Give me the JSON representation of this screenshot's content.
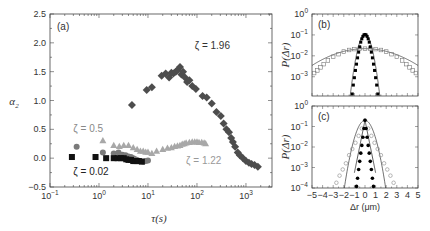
{
  "chart_data": [
    {
      "panel": "(a)",
      "type": "scatter",
      "title": "",
      "xlabel": "τ(s)",
      "ylabel": "α2",
      "xscale": "log",
      "xlim": [
        0.1,
        3400
      ],
      "ylim": [
        -0.5,
        2.5
      ],
      "xticks": [
        "10^-1",
        "10^0",
        "10^1",
        "10^2",
        "10^3"
      ],
      "yticks": [
        "-0.5",
        "0.0",
        "0.5",
        "1.0",
        "1.5",
        "2.0",
        "2.5"
      ],
      "grid": false,
      "series": [
        {
          "name": "ζ = 0.02",
          "marker": "square",
          "color": "#111111",
          "x": [
            0.28,
            0.85,
            1.4,
            2.0,
            2.4,
            2.8,
            3.2,
            3.6,
            4.0,
            4.5,
            5.0,
            5.5,
            6.0,
            6.5,
            7.5
          ],
          "y": [
            0.02,
            0.02,
            0.0,
            0.0,
            0.0,
            0.0,
            0.0,
            -0.02,
            -0.03,
            -0.03,
            -0.05,
            -0.05,
            -0.05,
            -0.05,
            -0.06
          ]
        },
        {
          "name": "ζ = 0.5",
          "marker": "circle",
          "color": "#7a7a7a",
          "x": [
            0.35,
            1.2,
            2.0,
            2.5,
            3.0,
            3.5,
            4.0,
            4.5,
            5.0,
            5.5,
            6.0,
            7.0,
            8.0,
            9.0,
            10.0
          ],
          "y": [
            0.2,
            0.1,
            0.08,
            0.1,
            0.06,
            0.05,
            0.03,
            0.02,
            0.0,
            -0.02,
            -0.03,
            -0.05,
            -0.06,
            -0.05,
            -0.04
          ]
        },
        {
          "name": "ζ = 1.22",
          "marker": "triangle",
          "color": "#a8a8a8",
          "x": [
            1.2,
            2.0,
            2.6,
            3.2,
            4.0,
            5.0,
            6.0,
            7.0,
            8.0,
            9.0,
            10.0,
            12.0,
            15.0,
            20.0,
            25.0,
            30.0,
            35.0,
            40.0,
            45.0,
            50.0,
            55.0,
            60.0,
            70.0,
            80.0,
            90.0,
            100.0,
            110.0,
            125.0,
            140.0,
            150.0
          ],
          "y": [
            0.3,
            0.22,
            0.2,
            0.22,
            0.22,
            0.18,
            0.15,
            0.12,
            0.12,
            0.1,
            0.1,
            0.08,
            0.12,
            0.15,
            0.17,
            0.18,
            0.2,
            0.21,
            0.22,
            0.24,
            0.25,
            0.26,
            0.27,
            0.28,
            0.28,
            0.28,
            0.27,
            0.27,
            0.26,
            0.25
          ]
        },
        {
          "name": "ζ = 1.96",
          "marker": "diamond",
          "color": "#4d4d4d",
          "x": [
            4.7,
            9.4,
            12.0,
            19.0,
            23.0,
            27.0,
            30.0,
            33.0,
            37.0,
            40.0,
            45.0,
            48.0,
            52.0,
            57.0,
            63.0,
            70.0,
            80.0,
            95.0,
            130.0,
            158.0,
            200.0,
            250.0,
            307.0,
            350.0,
            400.0,
            450.0,
            500.0,
            540.0,
            600.0,
            680.0,
            750.0,
            870.0,
            1000.0,
            1150.0,
            1300.0,
            1500.0,
            1750.0
          ],
          "y": [
            0.92,
            1.18,
            1.23,
            1.43,
            1.47,
            1.4,
            1.48,
            1.47,
            1.5,
            1.53,
            1.58,
            1.45,
            1.5,
            1.4,
            1.32,
            1.35,
            1.25,
            1.2,
            1.08,
            1.05,
            0.95,
            0.8,
            0.73,
            0.6,
            0.5,
            0.45,
            0.35,
            0.28,
            0.2,
            0.1,
            0.05,
            0.0,
            -0.05,
            -0.08,
            -0.1,
            -0.12,
            -0.15
          ]
        }
      ],
      "annotations": [
        {
          "text": "ζ = 1.96",
          "x": 90,
          "y": 1.9
        },
        {
          "text": "ζ = 0.5",
          "x": 0.3,
          "y": 0.45
        },
        {
          "text": "ζ = 1.22",
          "x": 60,
          "y": -0.1
        },
        {
          "text": "ζ = 0.02",
          "x": 0.3,
          "y": -0.3
        }
      ]
    },
    {
      "panel": "(b)",
      "type": "scatter",
      "xlabel": "",
      "ylabel": "P(Δr)",
      "yscale": "log",
      "xlim": [
        -5,
        5
      ],
      "ylim": [
        0.00012,
        1
      ],
      "yticks": [
        "10^0",
        "10^-1",
        "10^-2",
        "10^-3"
      ],
      "series": [
        {
          "name": "narrow (filled)",
          "marker": "filled-square",
          "color": "#000000",
          "x": [
            -1.2,
            -1.1,
            -1.0,
            -0.9,
            -0.8,
            -0.7,
            -0.6,
            -0.5,
            -0.4,
            -0.3,
            -0.2,
            -0.1,
            0.0,
            0.1,
            0.2,
            0.3,
            0.4,
            0.5,
            0.6,
            0.7,
            0.8,
            0.9,
            1.0,
            1.1,
            1.2
          ],
          "y": [
            0.00015,
            0.0004,
            0.0009,
            0.002,
            0.004,
            0.008,
            0.015,
            0.027,
            0.045,
            0.065,
            0.085,
            0.1,
            0.105,
            0.1,
            0.085,
            0.065,
            0.045,
            0.027,
            0.015,
            0.008,
            0.004,
            0.002,
            0.0009,
            0.0004,
            0.00015
          ]
        },
        {
          "name": "wide (open)",
          "marker": "open-square",
          "color": "#777777",
          "x": [
            -4.8,
            -4.5,
            -4.2,
            -3.9,
            -3.5,
            -3.0,
            -2.5,
            -2.0,
            -1.5,
            -1.0,
            -0.5,
            0.0,
            0.5,
            1.0,
            1.5,
            2.0,
            2.5,
            3.0,
            3.5,
            3.9,
            4.2,
            4.5,
            4.8
          ],
          "y": [
            0.0015,
            0.002,
            0.0028,
            0.004,
            0.006,
            0.009,
            0.012,
            0.016,
            0.019,
            0.021,
            0.022,
            0.022,
            0.022,
            0.021,
            0.019,
            0.016,
            0.012,
            0.009,
            0.006,
            0.004,
            0.0028,
            0.002,
            0.0015
          ]
        }
      ],
      "fits": [
        {
          "name": "narrow gaussian",
          "amp": 0.105,
          "sigma": 0.38
        },
        {
          "name": "wide gaussian",
          "amp": 0.022,
          "sigma": 2.6
        }
      ]
    },
    {
      "panel": "(c)",
      "type": "scatter",
      "xlabel": "Δr (μm)",
      "ylabel": "P(Δr)",
      "yscale": "log",
      "xlim": [
        -5,
        5
      ],
      "ylim": [
        0.0001,
        1
      ],
      "xticks": [
        "-5",
        "-4",
        "-3",
        "-2",
        "-1",
        "0",
        "1",
        "2",
        "3",
        "4",
        "5"
      ],
      "yticks": [
        "10^0",
        "10^-1",
        "10^-2",
        "10^-3",
        "10^-4"
      ],
      "series": [
        {
          "name": "narrow (filled)",
          "marker": "filled-circle",
          "color": "#000000",
          "x": [
            -0.8,
            -0.7,
            -0.6,
            -0.5,
            -0.4,
            -0.3,
            -0.2,
            -0.1,
            0.0,
            0.1,
            0.2,
            0.3,
            0.4,
            0.5,
            0.6,
            0.7,
            0.8
          ],
          "y": [
            0.00012,
            0.0003,
            0.0008,
            0.002,
            0.005,
            0.012,
            0.03,
            0.08,
            0.2,
            0.08,
            0.03,
            0.012,
            0.005,
            0.002,
            0.0008,
            0.0003,
            0.00012
          ]
        },
        {
          "name": "wide (open)",
          "marker": "open-circle",
          "color": "#888888",
          "x": [
            -2.7,
            -2.4,
            -2.1,
            -1.8,
            -1.5,
            -1.2,
            -0.9,
            -0.6,
            -0.3,
            0.0,
            0.3,
            0.6,
            0.9,
            1.2,
            1.5,
            1.8,
            2.1,
            2.4,
            2.7
          ],
          "y": [
            0.00018,
            0.0004,
            0.0008,
            0.0016,
            0.004,
            0.008,
            0.016,
            0.035,
            0.08,
            0.2,
            0.08,
            0.035,
            0.016,
            0.008,
            0.004,
            0.0016,
            0.0008,
            0.0004,
            0.00018
          ]
        }
      ],
      "fits": [
        {
          "name": "gaussian (thin line)",
          "amp": 0.2,
          "sigma": 0.5
        }
      ]
    }
  ]
}
